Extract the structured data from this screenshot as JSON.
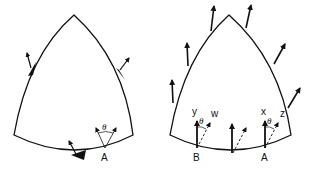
{
  "figures": [
    {
      "id": "left",
      "description": "Curved triangular region with tangential arrows on the boundary and angle theta at point A",
      "labels": {
        "point_a": "A",
        "angle": "θ"
      }
    },
    {
      "id": "right",
      "description": "Curved triangular region with vertical solid arrows along boundary and dashed rotated arrows at bottom",
      "labels": {
        "point_a": "A",
        "point_b": "B",
        "x": "x",
        "y": "y",
        "z": "z",
        "w": "w",
        "angle_a": "θ",
        "angle_b": "θ"
      }
    }
  ],
  "colors": {
    "stroke": "#111111",
    "background": "#ffffff"
  }
}
